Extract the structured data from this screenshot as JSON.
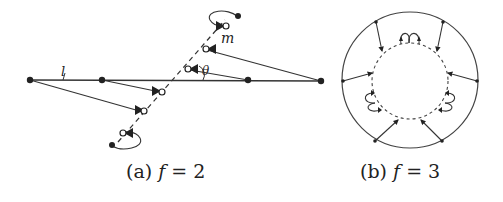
{
  "figure": {
    "panel_a": {
      "caption_prefix": "(a)",
      "caption_var": "f",
      "caption_eq": "= 2",
      "labels": {
        "line_l": "l",
        "line_m": "m",
        "angle": "θ"
      }
    },
    "panel_b": {
      "caption_prefix": "(b)",
      "caption_var": "f",
      "caption_eq": "= 3"
    },
    "colors": {
      "stroke": "#333333",
      "node": "#222222",
      "background": "#ffffff"
    }
  }
}
